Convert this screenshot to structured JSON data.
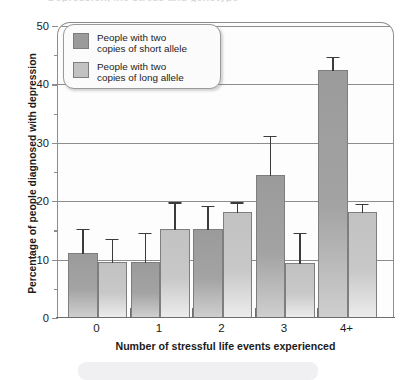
{
  "figure": {
    "title_sliver": "Depression, life stress and genotype",
    "bottom_panel": ""
  },
  "chart_data": {
    "type": "bar",
    "title": "",
    "xlabel": "Number of stressful life events experienced",
    "ylabel": "Percentage of people diagnosed with depression",
    "categories": [
      "0",
      "1",
      "2",
      "3",
      "4+"
    ],
    "ylim": [
      0,
      50
    ],
    "yticks": [
      0,
      10,
      20,
      30,
      40,
      50
    ],
    "ytick_labels": [
      "0",
      "10",
      "20",
      "30",
      "40",
      "50"
    ],
    "yminor_ticks": [
      5,
      15,
      25,
      35,
      45
    ],
    "grid": "horizontal",
    "legend_position": "upper-left-inside",
    "series": [
      {
        "name": "People with two\ncopies of short allele",
        "color": "#9b9b9b",
        "values": [
          11,
          9.4,
          15,
          24.3,
          42.3
        ],
        "err_upper": [
          15.3,
          14.6,
          19.2,
          31.2,
          44.7
        ]
      },
      {
        "name": "People with two\ncopies of long allele",
        "color": "#c2c2c2",
        "values": [
          9.4,
          15,
          18,
          9.2,
          18
        ],
        "err_upper": [
          13.6,
          19.8,
          19.8,
          14.6,
          19.6
        ]
      }
    ]
  },
  "legend": {
    "items": [
      {
        "label": "People with two\ncopies of short allele",
        "swatch": "dark"
      },
      {
        "label": "People with two\ncopies of long allele",
        "swatch": "light"
      }
    ]
  }
}
